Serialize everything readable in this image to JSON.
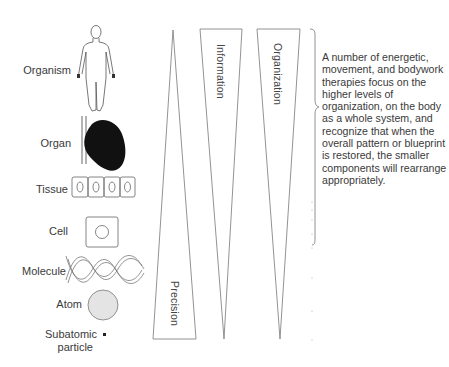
{
  "levels": [
    {
      "label": "Organism",
      "icon": "human-body-outline"
    },
    {
      "label": "Organ",
      "icon": "heart-organ"
    },
    {
      "label": "Tissue",
      "icon": "tissue-cells-row"
    },
    {
      "label": "Cell",
      "icon": "single-cell"
    },
    {
      "label": "Molecule",
      "icon": "dna-double-helix"
    },
    {
      "label": "Atom",
      "icon": "atom-sphere"
    },
    {
      "label": "Subatomic",
      "label2": "particle",
      "icon": "subatomic-dot"
    }
  ],
  "wedges": [
    {
      "label": "Precision",
      "direction": "widens-downward"
    },
    {
      "label": "Information",
      "direction": "narrows-downward"
    },
    {
      "label": "Organization",
      "direction": "narrows-downward"
    }
  ],
  "annotation": {
    "text": "A number of energetic, movement, and bodywork therapies focus on the higher levels of organization, on the body as a whole system, and recognize that when the overall pattern or blueprint is restored, the smaller components will rearrange appropriately."
  },
  "colors": {
    "line": "#777777",
    "heart": "#111111",
    "atom_fill": "#e4e4e4"
  }
}
